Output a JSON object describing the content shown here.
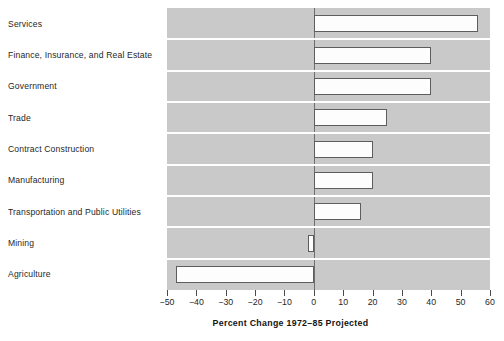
{
  "chart_data": {
    "type": "bar",
    "orientation": "horizontal",
    "title": "",
    "xlabel": "Percent Change 1972–85 Projected",
    "ylabel": "",
    "xlim": [
      -50,
      60
    ],
    "xticks": [
      -50,
      -40,
      -30,
      -20,
      -10,
      0,
      10,
      20,
      30,
      40,
      50,
      60
    ],
    "xtick_labels": [
      "−50",
      "−40",
      "−30",
      "−20",
      "−10",
      "0",
      "10",
      "20",
      "30",
      "40",
      "50",
      "60"
    ],
    "grid": false,
    "legend": null,
    "categories": [
      "Services",
      "Finance, Insurance, and Real Estate",
      "Government",
      "Trade",
      "Contract Construction",
      "Manufacturing",
      "Transportation and Public Utilities",
      "Mining",
      "Agriculture"
    ],
    "values": [
      56,
      40,
      40,
      25,
      20,
      20,
      16,
      -2,
      -47
    ],
    "bar_face_color": "#fdfdfd",
    "bar_edge_color": "#5d5d5d",
    "plot_background_color": "#c9c9c9",
    "row_separator_color": "#ffffff",
    "zero_line_color": "#6e6e6e",
    "page_background_color": "#ffffff"
  }
}
